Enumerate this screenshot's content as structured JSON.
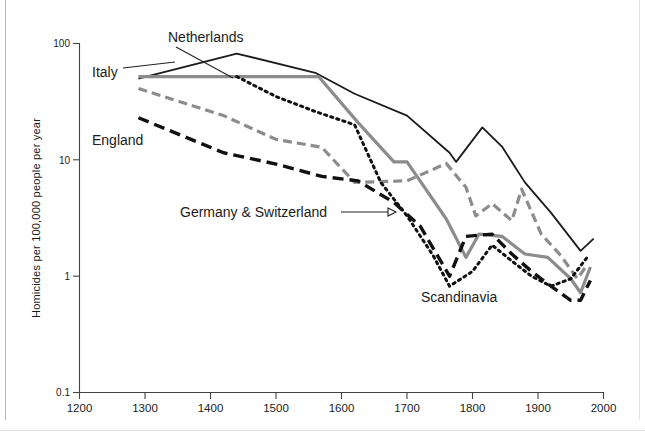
{
  "chart_data": {
    "type": "line",
    "title": "",
    "xlabel": "",
    "ylabel": "Homicides per 100,000 people per year",
    "yscale": "log",
    "ylim": [
      0.1,
      100
    ],
    "xlim": [
      1200,
      2000
    ],
    "grid": false,
    "legend": "inline-labels",
    "x_ticks": [
      1200,
      1300,
      1400,
      1500,
      1600,
      1700,
      1800,
      1900,
      2000
    ],
    "x_tick_labels": [
      "1200",
      "1300",
      "1400",
      "1500",
      "1600",
      "1700",
      "1800",
      "1900",
      "2000"
    ],
    "y_ticks": [
      0.1,
      1,
      10,
      100
    ],
    "y_tick_labels": [
      "0.1",
      "1",
      "10",
      "100"
    ],
    "series": [
      {
        "name": "Italy",
        "label": "Italy",
        "style": "solid",
        "color": "#1b1b1b",
        "points": [
          [
            1290,
            50
          ],
          [
            1440,
            82
          ],
          [
            1560,
            56
          ],
          [
            1620,
            37
          ],
          [
            1700,
            24
          ],
          [
            1765,
            11.5
          ],
          [
            1775,
            9.6
          ],
          [
            1815,
            19
          ],
          [
            1845,
            13
          ],
          [
            1880,
            6.4
          ],
          [
            1920,
            3.5
          ],
          [
            1965,
            1.65
          ],
          [
            1985,
            2.1
          ]
        ]
      },
      {
        "name": "Netherlands",
        "label": "Netherlands",
        "style": "dashed",
        "color": "#8c8c8c",
        "points": [
          [
            1290,
            41
          ],
          [
            1420,
            24
          ],
          [
            1500,
            15
          ],
          [
            1570,
            12.8
          ],
          [
            1620,
            6.4
          ],
          [
            1700,
            6.6
          ],
          [
            1760,
            9.3
          ],
          [
            1790,
            5.8
          ],
          [
            1805,
            3.3
          ],
          [
            1830,
            4.2
          ],
          [
            1860,
            3.0
          ],
          [
            1875,
            5.6
          ],
          [
            1905,
            2.3
          ],
          [
            1935,
            1.5
          ],
          [
            1960,
            0.95
          ],
          [
            1975,
            1.25
          ]
        ]
      },
      {
        "name": "Germany & Switzerland",
        "label": "Germany & Switzerland",
        "style": "solid",
        "color": "#8c8c8c",
        "points": [
          [
            1290,
            52
          ],
          [
            1440,
            52
          ],
          [
            1565,
            52
          ],
          [
            1625,
            21
          ],
          [
            1680,
            9.6
          ],
          [
            1700,
            9.6
          ],
          [
            1760,
            3.1
          ],
          [
            1790,
            1.45
          ],
          [
            1810,
            2.3
          ],
          [
            1845,
            2.2
          ],
          [
            1880,
            1.55
          ],
          [
            1915,
            1.45
          ],
          [
            1950,
            0.95
          ],
          [
            1965,
            0.72
          ],
          [
            1980,
            1.2
          ]
        ]
      },
      {
        "name": "England",
        "label": "England",
        "style": "dashed",
        "color": "#111111",
        "points": [
          [
            1290,
            23
          ],
          [
            1420,
            11.5
          ],
          [
            1500,
            9.2
          ],
          [
            1570,
            7.2
          ],
          [
            1625,
            6.6
          ],
          [
            1680,
            4.3
          ],
          [
            1720,
            2.7
          ],
          [
            1765,
            1.0
          ],
          [
            1790,
            2.2
          ],
          [
            1830,
            2.3
          ],
          [
            1860,
            1.55
          ],
          [
            1890,
            1.1
          ],
          [
            1925,
            0.78
          ],
          [
            1950,
            0.62
          ],
          [
            1965,
            0.62
          ],
          [
            1980,
            0.92
          ]
        ]
      },
      {
        "name": "Scandinavia",
        "label": "Scandinavia",
        "style": "dotted",
        "color": "#111111",
        "points": [
          [
            1440,
            52
          ],
          [
            1500,
            35
          ],
          [
            1560,
            26
          ],
          [
            1620,
            20
          ],
          [
            1660,
            6.4
          ],
          [
            1700,
            3.3
          ],
          [
            1740,
            1.5
          ],
          [
            1765,
            0.82
          ],
          [
            1800,
            1.1
          ],
          [
            1830,
            1.85
          ],
          [
            1860,
            1.35
          ],
          [
            1890,
            1.0
          ],
          [
            1920,
            0.82
          ],
          [
            1950,
            0.95
          ],
          [
            1975,
            1.45
          ]
        ]
      }
    ],
    "annotations": [
      {
        "text": "Italy",
        "x_px": 92,
        "y_px": 72
      },
      {
        "text": "Netherlands",
        "x_px": 168,
        "y_px": 39
      },
      {
        "text": "England",
        "x_px": 92,
        "y_px": 140
      },
      {
        "text": "Germany & Switzerland",
        "x_px": 180,
        "y_px": 216
      },
      {
        "text": "Scandinavia",
        "x_px": 421,
        "y_px": 298
      }
    ]
  },
  "axes": {
    "y_axis_title": "Homicides per 100,000 people per year",
    "y_tick_100": "100",
    "y_tick_10": "10",
    "y_tick_1": "1",
    "y_tick_01": "0.1",
    "x_tick_1200": "1200",
    "x_tick_1300": "1300",
    "x_tick_1400": "1400",
    "x_tick_1500": "1500",
    "x_tick_1600": "1600",
    "x_tick_1700": "1700",
    "x_tick_1800": "1800",
    "x_tick_1900": "1900",
    "x_tick_2000": "2000"
  },
  "labels": {
    "italy": "Italy",
    "netherlands": "Netherlands",
    "england": "England",
    "germany_switzerland": "Germany & Switzerland",
    "scandinavia": "Scandinavia"
  },
  "colors": {
    "dark": "#1b1b1b",
    "gray": "#8c8c8c",
    "axis": "#444444"
  }
}
